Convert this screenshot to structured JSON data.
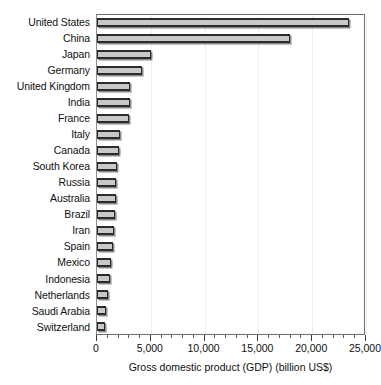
{
  "chart_data": {
    "type": "bar",
    "orientation": "horizontal",
    "title": "",
    "xlabel": "Gross domestic product (GDP) (billion US$)",
    "ylabel": "",
    "xlim": [
      0,
      25000
    ],
    "xticks": [
      0,
      5000,
      10000,
      15000,
      20000,
      25000
    ],
    "xtick_labels": [
      "0",
      "5,000",
      "10,000",
      "15,000",
      "20,000",
      "25,000"
    ],
    "minor_tick_interval": 1000,
    "grid": true,
    "grid_axis": "x",
    "legend": false,
    "categories": [
      "United States",
      "China",
      "Japan",
      "Germany",
      "United Kingdom",
      "India",
      "France",
      "Italy",
      "Canada",
      "South Korea",
      "Russia",
      "Australia",
      "Brazil",
      "Iran",
      "Spain",
      "Mexico",
      "Indonesia",
      "Netherlands",
      "Saudi Arabia",
      "Switzerland"
    ],
    "values": [
      23400,
      17900,
      5000,
      4200,
      3100,
      3100,
      2950,
      2100,
      2000,
      1820,
      1780,
      1720,
      1650,
      1600,
      1450,
      1300,
      1200,
      1020,
      840,
      760
    ],
    "bar_color": "#c9c9c9",
    "bar_edge_color": "#2b2b2b",
    "units": "billion US$"
  }
}
